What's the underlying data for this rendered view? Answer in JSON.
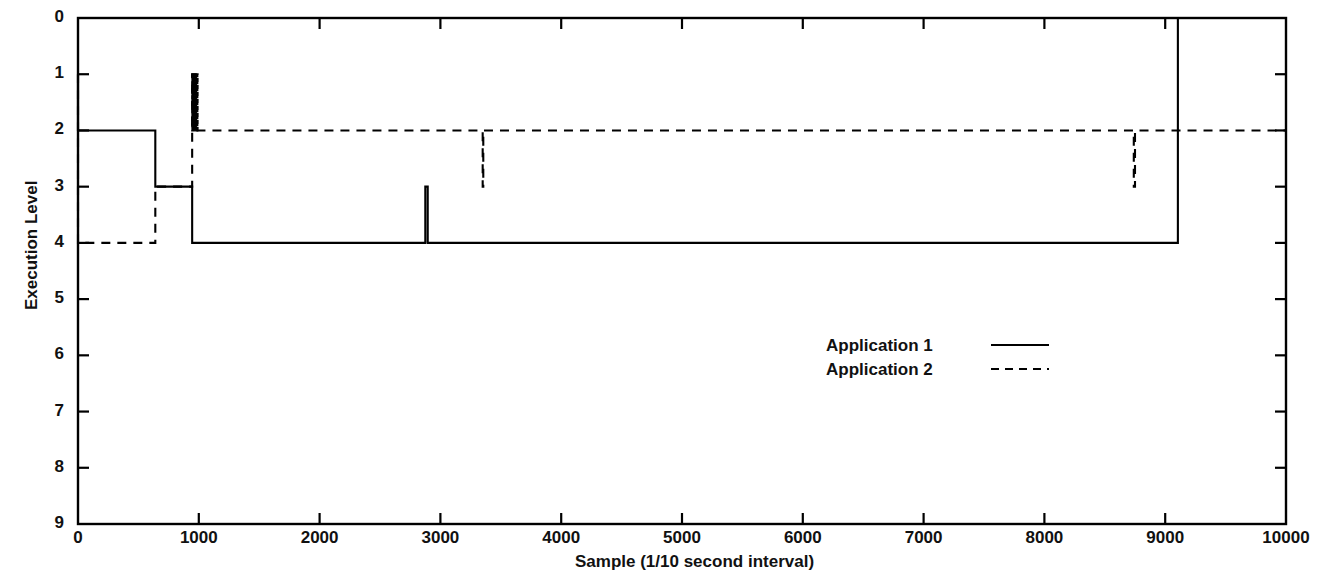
{
  "chart_data": {
    "type": "line",
    "title": "",
    "xlabel": "Sample (1/10 second interval)",
    "ylabel": "Execution Level",
    "xlim": [
      0,
      10000
    ],
    "ylim": [
      0,
      9
    ],
    "y_inverted": true,
    "grid": false,
    "legend_position": "center-right",
    "xticks": [
      0,
      1000,
      2000,
      3000,
      4000,
      5000,
      6000,
      7000,
      8000,
      9000,
      10000
    ],
    "xtick_labels": [
      "0",
      "1000",
      "2000",
      "3000",
      "4000",
      "5000",
      "6000",
      "7000",
      "8000",
      "9000",
      "10000"
    ],
    "yticks": [
      0,
      1,
      2,
      3,
      4,
      5,
      6,
      7,
      8,
      9
    ],
    "ytick_labels": [
      "0",
      "1",
      "2",
      "3",
      "4",
      "5",
      "6",
      "7",
      "8",
      "9"
    ],
    "series": [
      {
        "name": "Application 1",
        "style": "solid",
        "color": "#000000",
        "points": [
          [
            0,
            1
          ],
          [
            0,
            2
          ],
          [
            640,
            2
          ],
          [
            640,
            3
          ],
          [
            945,
            3
          ],
          [
            945,
            4
          ],
          [
            2875,
            4
          ],
          [
            2875,
            3
          ],
          [
            2895,
            3
          ],
          [
            2895,
            4
          ],
          [
            9105,
            4
          ],
          [
            9105,
            0
          ],
          [
            10000,
            0
          ]
        ]
      },
      {
        "name": "Application 2",
        "style": "dashed",
        "color": "#000000",
        "points": [
          [
            0,
            1
          ],
          [
            0,
            4
          ],
          [
            640,
            4
          ],
          [
            640,
            3
          ],
          [
            945,
            3
          ],
          [
            945,
            1
          ],
          [
            975,
            1
          ],
          [
            975,
            2
          ],
          [
            3350,
            2
          ],
          [
            3350,
            3
          ],
          [
            3355,
            3
          ],
          [
            3355,
            2
          ],
          [
            8740,
            2
          ],
          [
            8740,
            3
          ],
          [
            8750,
            3
          ],
          [
            8750,
            2
          ],
          [
            10000,
            2
          ]
        ],
        "oscillation": {
          "description": "rapid oscillation between execution level 1 and 2",
          "x_start": 945,
          "x_end": 990,
          "level_high": 1,
          "level_low": 2,
          "cycles": 11
        }
      }
    ],
    "annotations": [
      {
        "label": "Application 1 rises to level 0 (idle) near sample 9100",
        "x": 9105,
        "y": 0
      },
      {
        "label": "Application 1 brief spike to level 3 near sample 2880",
        "x": 2880,
        "y": 3
      },
      {
        "label": "Application 2 brief dip to level 3 near sample 3350",
        "x": 3350,
        "y": 3
      },
      {
        "label": "Application 2 brief dip to level 3 near sample 8745",
        "x": 8745,
        "y": 3
      }
    ]
  },
  "legend": {
    "entries": [
      {
        "label": "Application 1",
        "style": "solid"
      },
      {
        "label": "Application 2",
        "style": "dashed"
      }
    ]
  },
  "axes": {
    "x_axis_title": "Sample (1/10 second interval)",
    "y_axis_title": "Execution Level"
  }
}
